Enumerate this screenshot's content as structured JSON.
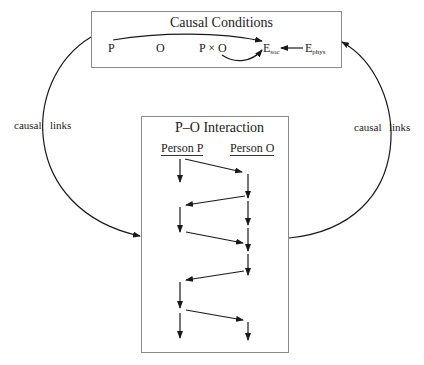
{
  "diagram": {
    "top_box": {
      "title": "Causal Conditions",
      "variables": {
        "p": "P",
        "o": "O",
        "interaction": "P × O",
        "e_soc_base": "E",
        "e_soc_sub": "soc",
        "e_phys_base": "E",
        "e_phys_sub": "phys"
      }
    },
    "bottom_box": {
      "title": "P–O Interaction",
      "column_p": "Person P",
      "column_o": "Person O"
    },
    "left_link": {
      "word1": "causal",
      "word2": "links"
    },
    "right_link": {
      "word1": "causal",
      "word2": "links"
    },
    "colors": {
      "line": "#1a1a1a",
      "box_border": "#8a8a8a",
      "text": "#222222"
    }
  }
}
